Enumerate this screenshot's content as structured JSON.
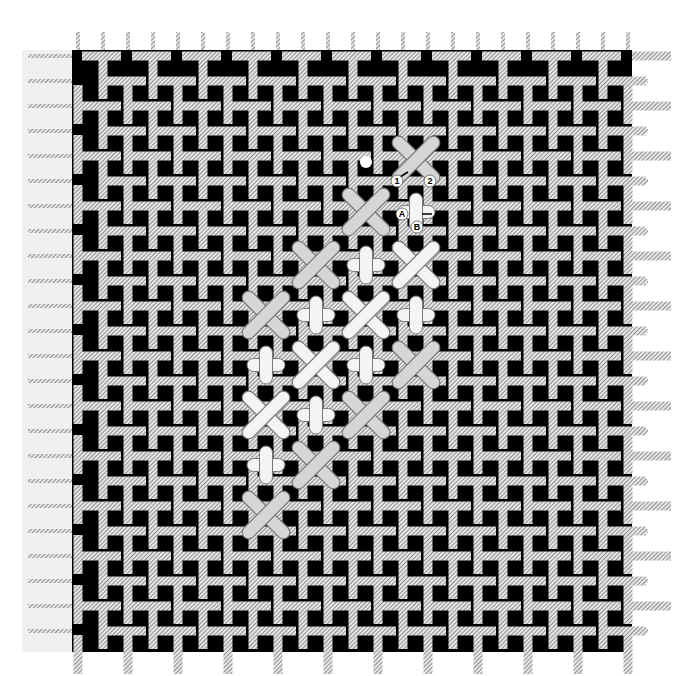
{
  "diagram": {
    "canvas": {
      "background": "#000000",
      "thread_color": "#dcdcdc",
      "hatch_color": "#444444",
      "margin_color": "#f0f0f0",
      "left": 72,
      "top": 50,
      "right": 632,
      "bottom": 652,
      "pitch": 25,
      "thread_width": 9
    },
    "stitch_colors": {
      "fill": "#f4f4f4",
      "fill_grey": "#d6d6d6",
      "outline": "#7a7a7a"
    },
    "cross_stitches": [
      {
        "x": 416,
        "y": 160,
        "tone": "grey"
      },
      {
        "x": 366,
        "y": 212,
        "tone": "grey"
      },
      {
        "x": 316,
        "y": 265,
        "tone": "grey"
      },
      {
        "x": 416,
        "y": 265,
        "tone": "white"
      },
      {
        "x": 266,
        "y": 315,
        "tone": "grey"
      },
      {
        "x": 366,
        "y": 315,
        "tone": "white"
      },
      {
        "x": 316,
        "y": 365,
        "tone": "white"
      },
      {
        "x": 416,
        "y": 365,
        "tone": "grey"
      },
      {
        "x": 266,
        "y": 415,
        "tone": "white"
      },
      {
        "x": 366,
        "y": 415,
        "tone": "grey"
      },
      {
        "x": 316,
        "y": 465,
        "tone": "grey"
      },
      {
        "x": 266,
        "y": 515,
        "tone": "grey"
      }
    ],
    "upright_crosses": [
      {
        "x": 416,
        "y": 212
      },
      {
        "x": 366,
        "y": 265
      },
      {
        "x": 316,
        "y": 315
      },
      {
        "x": 416,
        "y": 315
      },
      {
        "x": 266,
        "y": 365
      },
      {
        "x": 366,
        "y": 365
      },
      {
        "x": 316,
        "y": 415
      },
      {
        "x": 266,
        "y": 465
      }
    ],
    "start_dot": {
      "x": 366,
      "y": 162
    },
    "labels": [
      {
        "text": "1",
        "x": 397,
        "y": 184
      },
      {
        "text": "2",
        "x": 430,
        "y": 184
      },
      {
        "text": "A",
        "x": 402,
        "y": 217
      },
      {
        "text": "B",
        "x": 417,
        "y": 230
      }
    ],
    "arrows": [
      {
        "x1": 400,
        "y1": 177,
        "x2": 408,
        "y2": 172
      },
      {
        "x1": 422,
        "y1": 214,
        "x2": 432,
        "y2": 214
      }
    ]
  }
}
